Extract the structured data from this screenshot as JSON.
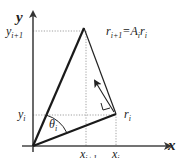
{
  "diagram": {
    "axes": {
      "x_label": "x",
      "y_label": "y"
    },
    "points": {
      "r_next": {
        "label": "r",
        "sub": "i+1",
        "eq": "=A",
        "eq_sub": "i",
        "eq_tail": "r",
        "eq_tail_sub": "i"
      },
      "r_cur": {
        "label": "r",
        "sub": "i"
      }
    },
    "ticks": {
      "y_next": {
        "label": "y",
        "sub": "i+1"
      },
      "y_cur": {
        "label": "y",
        "sub": "i"
      },
      "x_next": {
        "label": "x",
        "sub": "i+1"
      },
      "x_cur": {
        "label": "x",
        "sub": "i"
      }
    },
    "angle": {
      "label": "θ",
      "sub": "i"
    },
    "colors": {
      "axis": "#444444",
      "vector": "#1a1a1a",
      "guide": "#888888"
    }
  }
}
